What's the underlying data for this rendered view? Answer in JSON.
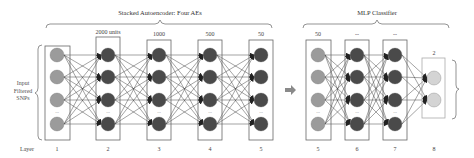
{
  "diagram": {
    "autoencoder_title": "Stacked Autoencoder: Four AEs",
    "mlp_title": "MLP Classifier",
    "input_label_lines": [
      "Input",
      "Filtered",
      "SNPs"
    ],
    "layer_row_label": "Layer",
    "ellipsis": "...",
    "colors": {
      "input_node": "#9b9b9b",
      "hidden_node": "#4a4a4a",
      "output_node": "#d4d4d4",
      "box_stroke": "#666666",
      "edge": "#333333",
      "arrow": "#8a8a8a"
    },
    "autoencoder_layers": [
      {
        "layer": "1",
        "units_label": "",
        "type": "input"
      },
      {
        "layer": "2",
        "units_label": "2000 units",
        "type": "hidden"
      },
      {
        "layer": "3",
        "units_label": "1000",
        "type": "hidden"
      },
      {
        "layer": "4",
        "units_label": "500",
        "type": "hidden"
      },
      {
        "layer": "5",
        "units_label": "50",
        "type": "hidden"
      }
    ],
    "mlp_layers": [
      {
        "layer": "5",
        "units_label": "50",
        "type": "input"
      },
      {
        "layer": "6",
        "units_label": "--",
        "type": "hidden"
      },
      {
        "layer": "7",
        "units_label": "--",
        "type": "hidden"
      },
      {
        "layer": "8",
        "units_label": "2",
        "type": "output"
      }
    ]
  }
}
